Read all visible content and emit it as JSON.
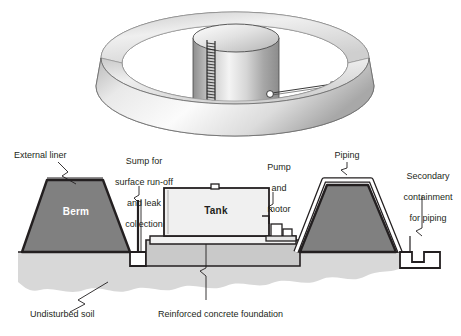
{
  "figure": {
    "type": "engineering-cross-section-diagram",
    "background_color": "#ffffff",
    "line_color": "#231f20"
  },
  "isometric_view": {
    "name": "3D cutaway of circular berm with cylindrical tank",
    "tank": {
      "label": "tank cylinder",
      "has_ladder": true,
      "ladder_rungs": 22
    },
    "berm_ring": {
      "label": "circular earthen berm / dike ring"
    },
    "pipe": {
      "label": "outlet pipe with valve"
    }
  },
  "cross_section": {
    "name": "section view through tank, berms and foundation"
  },
  "labels": {
    "external_liner": "External liner",
    "sump": "Sump for\nsurface run-off\nand leak\ncollection",
    "sump_lines": [
      "Sump for",
      "surface run-off",
      "and leak",
      "collection"
    ],
    "pump_and_motor": "Pump\nand\nmotor",
    "pump_lines": [
      "Pump",
      "and",
      "motor"
    ],
    "piping": "Piping",
    "secondary_containment": "Secondary\ncontainment\nfor piping",
    "secondary_lines": [
      "Secondary",
      "containment",
      "for piping"
    ],
    "undisturbed_soil": "Undisturbed soil",
    "reinforced_concrete_foundation": "Reinforced concrete foundation",
    "berm": "Berm",
    "tank": "Tank"
  },
  "colors": {
    "berm_fill": "#808080",
    "soil_fill": "#d8d8d8",
    "concrete_fill": "#c9c9c9",
    "tank_fill": "#f0f0f0",
    "outline": "#231f20",
    "white": "#ffffff",
    "metal_light": "#f2f2f2",
    "metal_mid": "#b9b9b9",
    "metal_dark": "#8e8e8e"
  }
}
